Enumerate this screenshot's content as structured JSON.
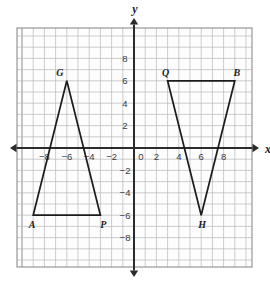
{
  "figure": {
    "title": "",
    "background_color": "#ffffff",
    "grid_color": "#b9b9bd",
    "axis_color": "#2b2b2b",
    "shape_color": "#1c1c1c"
  },
  "axes": {
    "x_label": "x",
    "y_label": "y",
    "origin_label": "0",
    "x_tick_labels": [
      "−8",
      "−6",
      "−4",
      "−2",
      "2",
      "4",
      "6",
      "8"
    ],
    "y_tick_labels": [
      "8",
      "6",
      "4",
      "2",
      "−2",
      "−4",
      "−6",
      "−8"
    ],
    "x_arrow_both_ends": true,
    "y_arrow_both_ends": true
  },
  "chart_data": {
    "type": "scatter",
    "title": "",
    "xlabel": "x",
    "ylabel": "y",
    "xlim": [
      -10.5,
      10.5
    ],
    "ylim": [
      -10.5,
      10.5
    ],
    "grid": true,
    "grid_step": 1,
    "tick_step": 2,
    "legend": "none",
    "x_ticks": [
      -8,
      -6,
      -4,
      -2,
      0,
      2,
      4,
      6,
      8
    ],
    "y_ticks": [
      -8,
      -6,
      -4,
      -2,
      0,
      2,
      4,
      6,
      8
    ],
    "annotations": [
      {
        "text": "G",
        "x": -6,
        "y": 6,
        "dx": -7,
        "dy": -5
      },
      {
        "text": "A",
        "x": -9,
        "y": -6,
        "dx": -1,
        "dy": 13
      },
      {
        "text": "P",
        "x": -3,
        "y": -6,
        "dx": 3,
        "dy": 13
      },
      {
        "text": "Q",
        "x": 3,
        "y": 6,
        "dx": -2,
        "dy": -5
      },
      {
        "text": "B",
        "x": 9,
        "y": 6,
        "dx": 2,
        "dy": -5
      },
      {
        "text": "H",
        "x": 6,
        "y": -6,
        "dx": 1,
        "dy": 13
      }
    ],
    "series": [
      {
        "name": "triangle-AGP",
        "type": "polygon",
        "closed": true,
        "vertices": [
          {
            "label": "A",
            "x": -9,
            "y": -6
          },
          {
            "label": "G",
            "x": -6,
            "y": 6
          },
          {
            "label": "P",
            "x": -3,
            "y": -6
          }
        ]
      },
      {
        "name": "triangle-QBH",
        "type": "polygon",
        "closed": true,
        "vertices": [
          {
            "label": "Q",
            "x": 3,
            "y": 6
          },
          {
            "label": "B",
            "x": 9,
            "y": 6
          },
          {
            "label": "H",
            "x": 6,
            "y": -6
          }
        ]
      }
    ]
  }
}
